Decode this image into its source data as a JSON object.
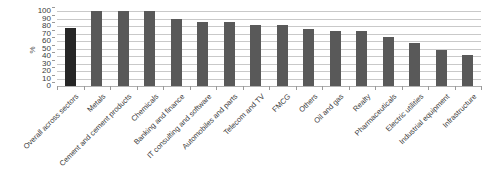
{
  "chart_data": {
    "type": "bar",
    "title": "",
    "subtitle": "",
    "xlabel": "",
    "ylabel": "%",
    "ylim": [
      0,
      100
    ],
    "yticks": [
      100,
      90,
      80,
      70,
      60,
      50,
      40,
      30,
      20,
      10,
      0
    ],
    "grid": true,
    "legend": "none",
    "orientation": "vertical",
    "categories": [
      "Overall across sectors",
      "Metals",
      "Cement and cement products",
      "Chemicals",
      "Banking and finance",
      "IT consulting and software",
      "Automobiles and parts",
      "Telecom and TV",
      "FMCG",
      "Others",
      "Oil and gas",
      "Realty",
      "Pharmaceuticals",
      "Electric utilities",
      "Industrial equipment",
      "Infrastructure"
    ],
    "values": [
      77,
      100,
      100,
      100,
      89,
      86,
      86,
      82,
      81,
      76,
      73,
      73,
      65,
      57,
      48,
      41
    ],
    "highlight_index": 0,
    "colors": {
      "bar": "#595959",
      "bar_highlight": "#262626",
      "gridline": "#c9c9c9",
      "axis": "#9a9a9a",
      "text": "#3b3b3b",
      "background": "#ffffff"
    }
  }
}
